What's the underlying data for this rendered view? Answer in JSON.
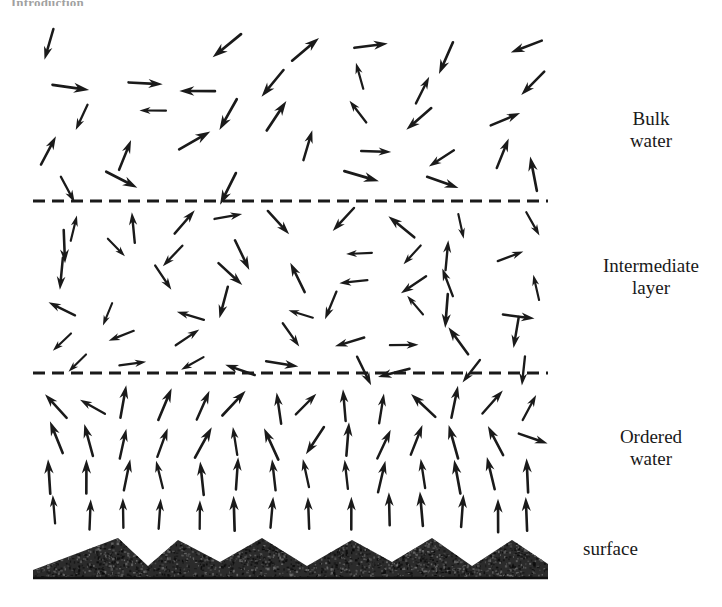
{
  "page": {
    "running_header": "Introduction",
    "width": 722,
    "height": 607
  },
  "figure": {
    "name": "water-structure-near-surface",
    "ink_color": "#1a1a1a",
    "surface_color": "#2b2b2b",
    "zones": [
      {
        "id": "bulk-water",
        "label": "Bulk\nwater",
        "y_top": 22,
        "y_bottom": 201,
        "order": "random",
        "arrow_density": "low",
        "arrow_count": 34
      },
      {
        "id": "intermediate-layer",
        "label": "Intermediate\nlayer",
        "y_top": 201,
        "y_bottom": 373,
        "order": "partially-random",
        "arrow_density": "medium",
        "arrow_count": 52
      },
      {
        "id": "ordered-water",
        "label": "Ordered\nwater",
        "y_top": 373,
        "y_bottom": 538,
        "order": "aligned-upward",
        "arrow_density": "high",
        "arrow_count": 86
      },
      {
        "id": "surface",
        "label": "surface",
        "y_top": 538,
        "y_bottom": 578,
        "order": "solid",
        "arrow_density": "none",
        "arrow_count": 0
      }
    ],
    "dividers": [
      {
        "id": "divider-bulk-intermediate",
        "y": 201,
        "x_start": 33,
        "x_end": 548,
        "style": "dashed"
      },
      {
        "id": "divider-intermediate-ordered",
        "y": 373,
        "x_start": 33,
        "x_end": 548,
        "style": "dashed"
      }
    ],
    "surface_profile": {
      "x_start": 33,
      "x_end": 548,
      "baseline_y": 578,
      "peak_y": 538,
      "valley_y": 562,
      "peaks_x": [
        118,
        178,
        262,
        352,
        432,
        512
      ],
      "texture": "stippled-granular"
    }
  },
  "labels": {
    "bulk": "Bulk\nwater",
    "intermediate": "Intermediate\nlayer",
    "ordered": "Ordered\nwater",
    "surface": "surface"
  }
}
